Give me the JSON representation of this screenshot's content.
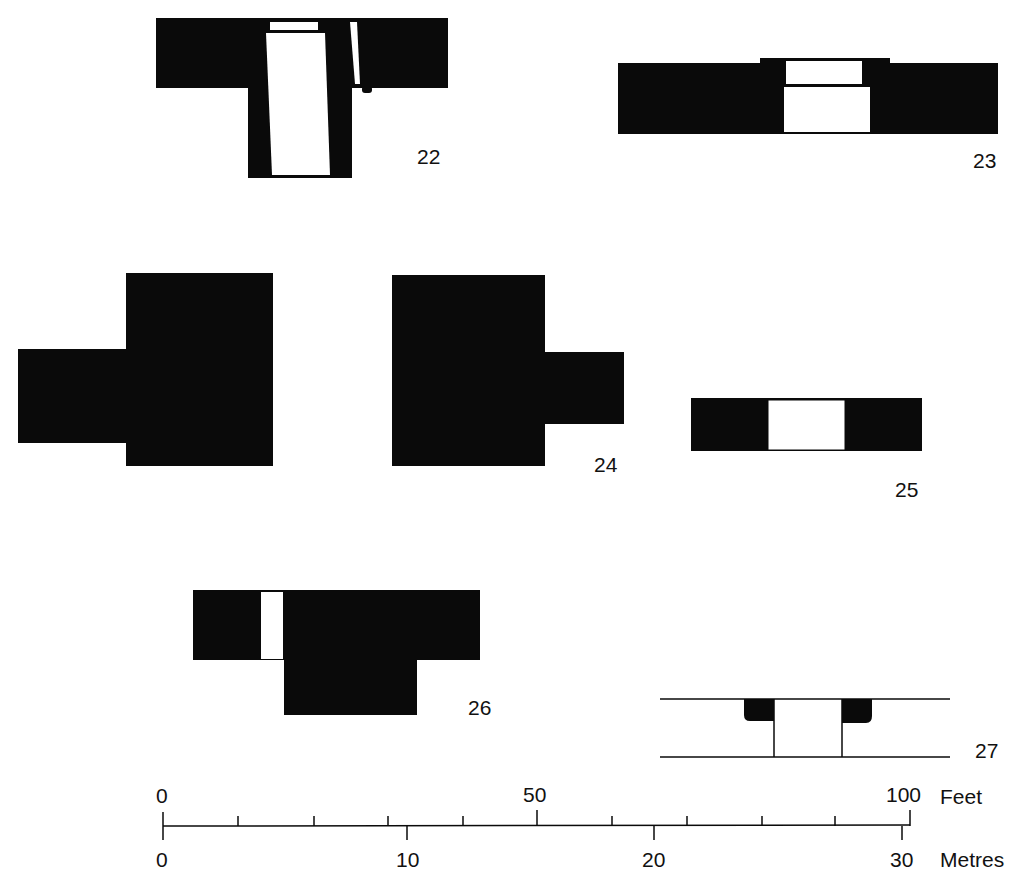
{
  "figures": [
    {
      "id": "22",
      "label": "22"
    },
    {
      "id": "23",
      "label": "23"
    },
    {
      "id": "24",
      "label": "24"
    },
    {
      "id": "25",
      "label": "25"
    },
    {
      "id": "26",
      "label": "26"
    },
    {
      "id": "27",
      "label": "27"
    }
  ],
  "scale": {
    "feet": {
      "start": "0",
      "mid": "50",
      "end": "100",
      "unit": "Feet"
    },
    "metres": {
      "start": "0",
      "t10": "10",
      "t20": "20",
      "end": "30",
      "unit": "Metres"
    }
  },
  "colors": {
    "ink": "#0a0a0a",
    "paper": "#ffffff"
  }
}
